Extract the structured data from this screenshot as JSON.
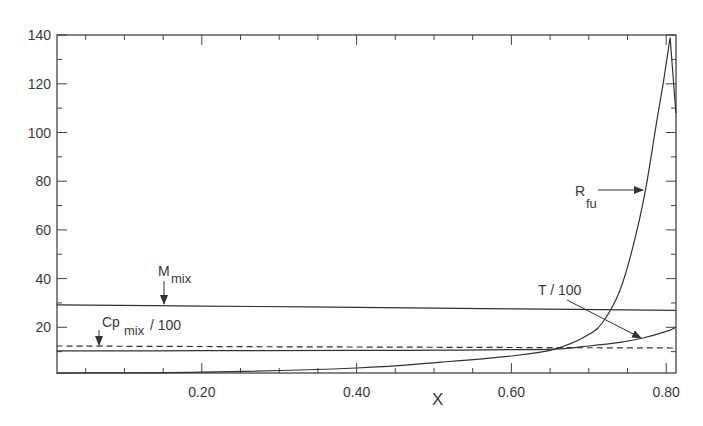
{
  "chart_data": {
    "type": "line",
    "title": "",
    "xlabel": "X",
    "ylabel": "",
    "xlim": [
      0.0125,
      0.8125
    ],
    "ylim": [
      1,
      140
    ],
    "grid": false,
    "legend": "none (curves labeled by inline annotations with arrows)",
    "x_ticks": [
      0.2,
      0.4,
      0.6,
      0.8
    ],
    "x_tick_labels": [
      "0.20",
      "0.40",
      "0.60",
      "0.80"
    ],
    "y_ticks": [
      20,
      40,
      60,
      80,
      100,
      120,
      140
    ],
    "y_tick_labels": [
      "20",
      "40",
      "60",
      "80",
      "100",
      "120",
      "140"
    ],
    "series": [
      {
        "name": "M_mix",
        "style": "solid",
        "x": [
          0.0125,
          0.2,
          0.4,
          0.6,
          0.8125
        ],
        "y": [
          29.2,
          28.7,
          28.2,
          27.6,
          27.0
        ]
      },
      {
        "name": "Cp_mix / 100",
        "style": "dashed",
        "x": [
          0.0125,
          0.2,
          0.4,
          0.6,
          0.8125
        ],
        "y": [
          12.3,
          12.1,
          11.9,
          11.7,
          11.5
        ]
      },
      {
        "name": "T / 100",
        "style": "solid",
        "x": [
          0.0125,
          0.2,
          0.4,
          0.5,
          0.6,
          0.656,
          0.7,
          0.74,
          0.77,
          0.8,
          0.8125
        ],
        "y": [
          10.3,
          10.4,
          10.5,
          10.6,
          10.8,
          11.0,
          12.3,
          13.8,
          15.6,
          18.3,
          20.0
        ]
      },
      {
        "name": "R_fu",
        "style": "solid",
        "x": [
          0.0125,
          0.2,
          0.4,
          0.51,
          0.6,
          0.656,
          0.7,
          0.72,
          0.74,
          0.757,
          0.773,
          0.788,
          0.797,
          0.805,
          0.8125
        ],
        "y": [
          1.2,
          1.6,
          3.3,
          5.7,
          8.2,
          11.0,
          17.0,
          23.0,
          35.0,
          53.0,
          76.0,
          105.0,
          122.0,
          139.0,
          108.0
        ]
      }
    ],
    "annotations": [
      {
        "text": "M",
        "sub": "mix",
        "arrow_to": [
          0.15,
          29.0
        ]
      },
      {
        "text": "Cp",
        "sub": "mix",
        "suffix": " / 100",
        "arrow_to": [
          0.068,
          12.3
        ]
      },
      {
        "text": "T / 100",
        "arrow_to": [
          0.77,
          15.8
        ]
      },
      {
        "text": "R",
        "sub": "fu",
        "arrow_to": [
          0.772,
          76
        ]
      }
    ]
  },
  "labels": {
    "x_axis_title": "X",
    "y_ticks": [
      "20",
      "40",
      "60",
      "80",
      "100",
      "120",
      "140"
    ],
    "x_ticks": [
      "0.20",
      "0.40",
      "0.60",
      "0.80"
    ],
    "m_mix_main": "M",
    "m_mix_sub": "mix",
    "cp_main": "Cp",
    "cp_sub": "mix",
    "cp_suffix": "/ 100",
    "t_label": "T / 100",
    "r_main": "R",
    "r_sub": "fu"
  }
}
